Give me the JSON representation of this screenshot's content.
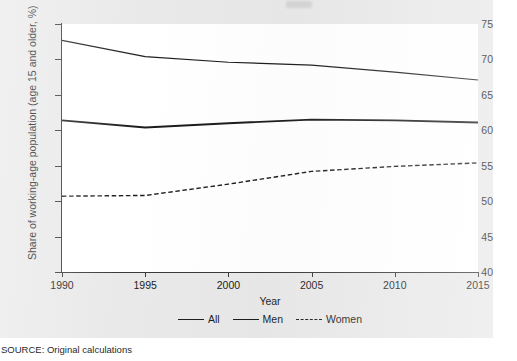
{
  "figure": {
    "source_note": "SOURCE: Original calculations"
  },
  "chart_data": {
    "type": "line",
    "title": "",
    "xlabel": "Year",
    "ylabel": "Share of working-age population (age 15 and older, %)",
    "xlim": [
      1990,
      2015
    ],
    "ylim": [
      40,
      75
    ],
    "xticks": [
      1990,
      1995,
      2000,
      2005,
      2010,
      2015
    ],
    "yticks": [
      40,
      45,
      50,
      55,
      60,
      65,
      70,
      75
    ],
    "xticklabels": [
      "1990",
      "1995",
      "2000",
      "2005",
      "2010",
      "2015"
    ],
    "yticklabels": [
      "40",
      "45",
      "50",
      "55",
      "60",
      "65",
      "70",
      "75"
    ],
    "grid": false,
    "legend_position": "bottom",
    "x": [
      1990,
      1995,
      2000,
      2005,
      2010,
      2015
    ],
    "series": [
      {
        "name": "All",
        "style": "solid",
        "width": 1.9,
        "color": "#1d1d1d",
        "values": [
          61.4,
          60.4,
          61.0,
          61.5,
          61.4,
          61.1
        ]
      },
      {
        "name": "Men",
        "style": "solid",
        "width": 1.2,
        "color": "#1d1d1d",
        "values": [
          72.7,
          70.4,
          69.6,
          69.2,
          68.2,
          67.1
        ]
      },
      {
        "name": "Women",
        "style": "dashed",
        "width": 1.4,
        "color": "#1d1d1d",
        "values": [
          50.7,
          50.8,
          52.4,
          54.2,
          54.9,
          55.4
        ]
      }
    ]
  }
}
